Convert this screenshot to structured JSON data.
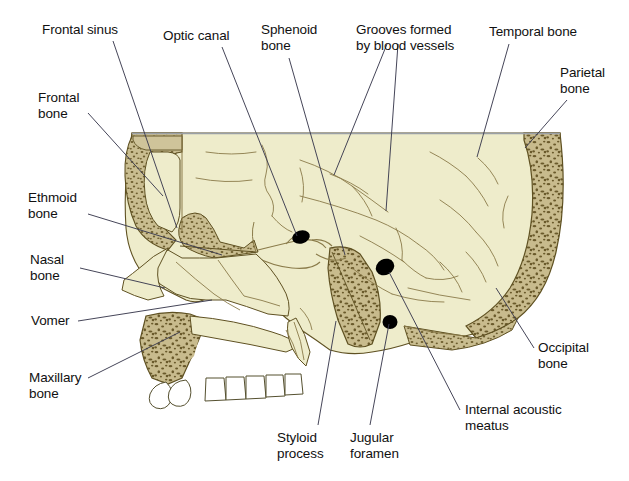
{
  "figure": {
    "width": 629,
    "height": 481,
    "background_color": "#ffffff"
  },
  "palette": {
    "cranial_cavity_fill": "#eeeccb",
    "compact_bone_fill": "#cfc49a",
    "spongy_bone_fill": "#c6b98c",
    "spongy_speckle": "#6b5a2c",
    "outline_stroke": "#5f5122",
    "suture_stroke": "#8a7b4a",
    "foramen_black": "#000000",
    "tooth_fill": "#ffffff",
    "tooth_stroke": "#55502f",
    "top_rule": "#9aa0a6",
    "leader_line": "#3b3b4f",
    "label_text": "#111111"
  },
  "labels": [
    {
      "id": "frontal-sinus",
      "text": "Frontal sinus",
      "x": 42,
      "y": 22,
      "align": "left"
    },
    {
      "id": "optic-canal",
      "text": "Optic canal",
      "x": 163,
      "y": 28,
      "align": "left"
    },
    {
      "id": "sphenoid-bone",
      "text": "Sphenoid\nbone",
      "x": 261,
      "y": 22,
      "align": "left"
    },
    {
      "id": "grooves-blood-vessels",
      "text": "Grooves formed\nby blood vessels",
      "x": 356,
      "y": 22,
      "align": "left"
    },
    {
      "id": "temporal-bone",
      "text": "Temporal bone",
      "x": 489,
      "y": 24,
      "align": "left"
    },
    {
      "id": "parietal-bone",
      "text": "Parietal\nbone",
      "x": 560,
      "y": 65,
      "align": "left"
    },
    {
      "id": "frontal-bone",
      "text": "Frontal\nbone",
      "x": 38,
      "y": 90,
      "align": "left"
    },
    {
      "id": "ethmoid-bone",
      "text": "Ethmoid\nbone",
      "x": 28,
      "y": 190,
      "align": "left"
    },
    {
      "id": "nasal-bone",
      "text": "Nasal\nbone",
      "x": 30,
      "y": 252,
      "align": "left"
    },
    {
      "id": "vomer",
      "text": "Vomer",
      "x": 31,
      "y": 313,
      "align": "left"
    },
    {
      "id": "maxillary-bone",
      "text": "Maxillary\nbone",
      "x": 29,
      "y": 370,
      "align": "left"
    },
    {
      "id": "occipital-bone",
      "text": "Occipital\nbone",
      "x": 538,
      "y": 340,
      "align": "left"
    },
    {
      "id": "styloid-process",
      "text": "Styloid\nprocess",
      "x": 277,
      "y": 430,
      "align": "left"
    },
    {
      "id": "jugular-foramen",
      "text": "Jugular\nforamen",
      "x": 350,
      "y": 430,
      "align": "left"
    },
    {
      "id": "internal-acoustic-meatus",
      "text": "Internal acoustic\nmeatus",
      "x": 465,
      "y": 402,
      "align": "left"
    }
  ],
  "leader_lines": [
    {
      "id": "frontal-sinus-leader",
      "points": "113,41 177,228"
    },
    {
      "id": "optic-canal-leader",
      "points": "222,47 297,236"
    },
    {
      "id": "sphenoid-bone-leader",
      "points": "289,58 345,255"
    },
    {
      "id": "grooves-leader-a",
      "points": "387,44 334,175"
    },
    {
      "id": "grooves-leader-b",
      "points": "398,44 386,211"
    },
    {
      "id": "temporal-bone-leader",
      "points": "509,44 477,157"
    },
    {
      "id": "parietal-bone-leader",
      "points": "567,100 525,148"
    },
    {
      "id": "frontal-bone-leader",
      "points": "88,113 163,196"
    },
    {
      "id": "ethmoid-bone-leader",
      "points": "88,214 222,255"
    },
    {
      "id": "nasal-bone-leader",
      "points": "80,268 165,288"
    },
    {
      "id": "vomer-leader",
      "points": "78,321 212,300"
    },
    {
      "id": "maxillary-bone-leader",
      "points": "88,378 180,332"
    },
    {
      "id": "occipital-bone-leader",
      "points": "534,348 496,288"
    },
    {
      "id": "styloid-process-leader",
      "points": "318,425 336,321"
    },
    {
      "id": "jugular-foramen-leader",
      "points": "370,425 389,324"
    },
    {
      "id": "internal-acoustic-leader",
      "points": "460,410 389,272"
    }
  ],
  "anatomy_regions": [
    {
      "id": "cranial-cavity",
      "name": "Cranial cavity (endocranial surface)"
    },
    {
      "id": "frontal-sinus-cavity",
      "name": "Frontal sinus air space"
    },
    {
      "id": "sphenoid-body",
      "name": "Sphenoid bone body (spongy)"
    },
    {
      "id": "petrous-temporal",
      "name": "Petrous portion of temporal bone"
    },
    {
      "id": "occipital-plate",
      "name": "Occipital bone plate"
    },
    {
      "id": "parietal-plate",
      "name": "Parietal / occipital diploe wall"
    },
    {
      "id": "maxilla",
      "name": "Maxillary bone with spongy interior"
    },
    {
      "id": "nasal-region",
      "name": "Nasal bone and nasal septum region"
    },
    {
      "id": "teeth",
      "name": "Upper dental arch"
    }
  ],
  "foramina": [
    {
      "id": "optic-canal-opening",
      "name": "Optic canal",
      "cx": 301,
      "cy": 237,
      "rx": 9,
      "ry": 6.5
    },
    {
      "id": "internal-acoustic-opening",
      "name": "Internal acoustic meatus",
      "cx": 385,
      "cy": 267,
      "rx": 9.5,
      "ry": 8
    },
    {
      "id": "jugular-foramen-opening",
      "name": "Jugular foramen",
      "cx": 390,
      "cy": 322,
      "rx": 7.5,
      "ry": 7
    }
  ]
}
